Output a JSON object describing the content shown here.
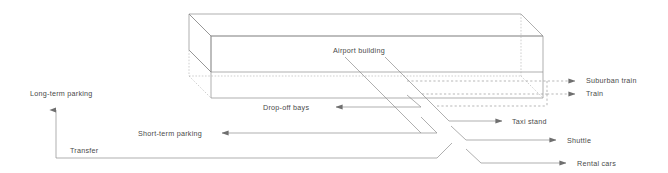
{
  "diagram": {
    "type": "schematic-isometric",
    "canvas": {
      "width": 668,
      "height": 173
    },
    "colors": {
      "stroke": "#8c8c8c",
      "stroke_dashed": "#9a9a9a",
      "text": "#4a4a4a",
      "background": "#ffffff"
    },
    "building": {
      "name": "Airport building",
      "label": "Airport building",
      "shape": "extruded rectangular box, isometric, hidden edges dashed"
    },
    "labels": [
      {
        "id": "airport-building",
        "text": "Airport building",
        "x": 333,
        "y": 51,
        "align": "left"
      },
      {
        "id": "long-term-parking",
        "text": "Long-term parking",
        "x": 30,
        "y": 93,
        "align": "left"
      },
      {
        "id": "transfer",
        "text": "Transfer",
        "x": 70,
        "y": 150,
        "align": "left"
      },
      {
        "id": "short-term-parking",
        "text": "Short-term parking",
        "x": 138,
        "y": 135,
        "align": "left"
      },
      {
        "id": "drop-off-bays",
        "text": "Drop-off bays",
        "x": 263,
        "y": 117,
        "align": "left"
      },
      {
        "id": "suburban-train",
        "text": "Suburban train",
        "x": 586,
        "y": 80,
        "align": "left"
      },
      {
        "id": "train",
        "text": "Train",
        "x": 586,
        "y": 93,
        "align": "left"
      },
      {
        "id": "taxi-stand",
        "text": "Taxi stand",
        "x": 512,
        "y": 117,
        "align": "left"
      },
      {
        "id": "shuttle",
        "text": "Shuttle",
        "x": 567,
        "y": 136,
        "align": "left"
      },
      {
        "id": "rental-cars",
        "text": "Rental cars",
        "x": 577,
        "y": 159,
        "align": "left"
      }
    ],
    "connections": [
      {
        "id": "suburban-train",
        "label": "Suburban train",
        "style": "dashed",
        "direction": "right"
      },
      {
        "id": "train",
        "label": "Train",
        "style": "dashed",
        "direction": "right"
      },
      {
        "id": "taxi-stand",
        "label": "Taxi stand",
        "style": "solid",
        "direction": "right"
      },
      {
        "id": "shuttle",
        "label": "Shuttle",
        "style": "solid",
        "direction": "right"
      },
      {
        "id": "rental-cars",
        "label": "Rental cars",
        "style": "solid",
        "direction": "right"
      },
      {
        "id": "drop-off-bays",
        "label": "Drop-off bays",
        "style": "solid",
        "direction": "left"
      },
      {
        "id": "short-term-parking",
        "label": "Short-term parking",
        "style": "solid",
        "direction": "left"
      },
      {
        "id": "long-term-parking",
        "label": "Long-term parking",
        "style": "solid",
        "direction": "up"
      },
      {
        "id": "transfer",
        "label": "Transfer",
        "style": "solid",
        "direction": "none"
      }
    ]
  }
}
